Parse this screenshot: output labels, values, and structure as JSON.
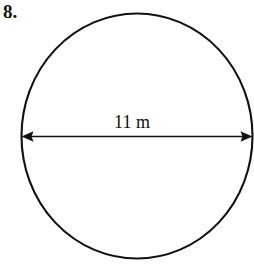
{
  "figure": {
    "problem_number": "8.",
    "dimension_label": "11 m",
    "shape_name": "circle",
    "diameter_value": "11",
    "diameter_unit": "m",
    "stroke_color": "#111111",
    "background_color": "#ffffff",
    "arrow_label_icon": "double-headed-arrow-icon",
    "geometry": {
      "center_x": "137",
      "center_y": "136",
      "radius_x": "116",
      "radius_y": "123",
      "arrow_y": "136",
      "arrow_left_x": "22",
      "arrow_right_x": "252"
    }
  }
}
